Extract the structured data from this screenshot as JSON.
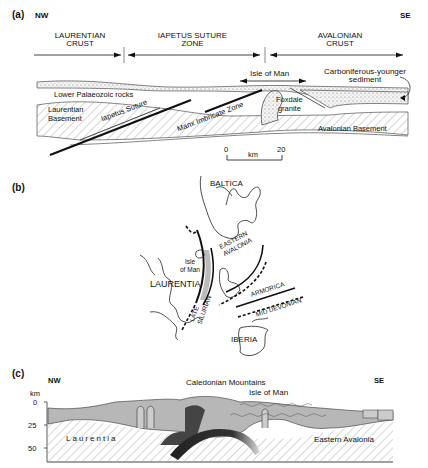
{
  "panel_a": {
    "tag": "(a)",
    "nw": "NW",
    "se": "SE",
    "zones": {
      "laurentian_crust_1": "LAURENTIAN",
      "laurentian_crust_2": "CRUST",
      "iapetus_1": "IAPETUS SUTURE",
      "iapetus_2": "ZONE",
      "avalonian_1": "AVALONIAN",
      "avalonian_2": "CRUST"
    },
    "labels": {
      "isle_of_man": "Isle of Man",
      "carboniferous_1": "Carboniferous-younger",
      "carboniferous_2": "sediment",
      "lower_palaeozoic": "Lower Palaeozoic rocks",
      "laurentian_basement_1": "Laurentian",
      "laurentian_basement_2": "Basement",
      "iapetus_suture": "Iapetus Suture",
      "manx_imbricate": "Manx Imbricate Zone",
      "foxdale_1": "Foxdale",
      "foxdale_2": "granite",
      "avalonian_basement": "Avalonian Basement"
    },
    "scale": {
      "start": "0",
      "unit": "km",
      "end": "20"
    }
  },
  "panel_b": {
    "tag": "(b)",
    "labels": {
      "baltica": "BALTICA",
      "eastern_avalonia_1": "EASTERN",
      "eastern_avalonia_2": "AVALONIA",
      "isle_of_man_1": "Isle",
      "isle_of_man_2": "of Man",
      "laurentia": "LAURENTIA",
      "armorica": "ARMORICA",
      "mid_devonian": "MID DEVONIAN",
      "late_silurian_1": "LATE",
      "late_silurian_2": "SILURIAN",
      "iberia": "IBERIA"
    }
  },
  "panel_c": {
    "tag": "(c)",
    "nw": "NW",
    "se": "SE",
    "title": "Caledonian Mountains",
    "isle_of_man": "Isle of Man",
    "axis_unit": "km",
    "ticks": [
      "0",
      "25",
      "50"
    ],
    "laurentia": "Laurentia",
    "eastern_avalonia": "Eastern Avalonia"
  }
}
